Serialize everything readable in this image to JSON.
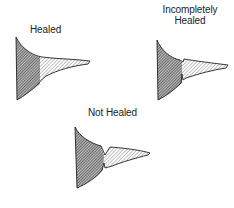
{
  "diagram": {
    "panels": [
      {
        "id": "healed",
        "label": "Healed"
      },
      {
        "id": "incompletely-healed",
        "label_line1": "Incompletely",
        "label_line2": "Healed"
      },
      {
        "id": "not-healed",
        "label": "Not Healed"
      }
    ],
    "colors": {
      "stroke": "#222222",
      "dark_hatch": "#555555",
      "light_hatch": "#9a9a9a"
    }
  }
}
